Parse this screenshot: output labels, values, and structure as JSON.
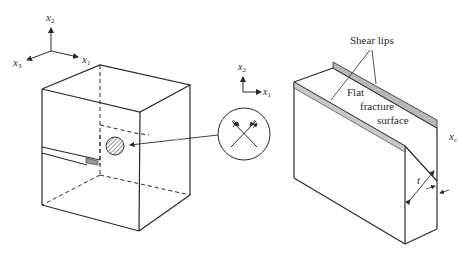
{
  "diagram": {
    "type": "fracture-mechanics-illustration",
    "left_panel": {
      "axes": {
        "x1_label": "x",
        "x1_sub": "1",
        "x2_label": "x",
        "x2_sub": "2",
        "x3_label": "x",
        "x3_sub": "3"
      },
      "specimen": "cracked rectangular block with hatched circular plastic zone",
      "inset_axes": {
        "x1_label": "x",
        "x1_sub": "1",
        "x2_label": "x",
        "x2_sub": "2"
      },
      "inset": "magnified circle showing crossing shear bands with arrows"
    },
    "right_panel": {
      "labels": {
        "shear_lips": "Shear lips",
        "flat": "Flat",
        "fracture": "fracture",
        "surface": "surface",
        "thickness": "t",
        "shear_lip_width": "x",
        "shear_lip_width_sub": "c"
      }
    },
    "colors": {
      "line": "#2a2a2a",
      "shear_lip_fill": "#b8b8b8",
      "leader_green": "#7fbf7f",
      "crack_fill": "#9a9a9a"
    }
  }
}
